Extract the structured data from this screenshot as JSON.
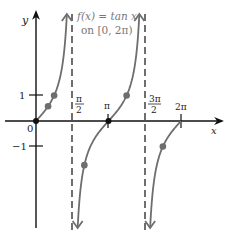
{
  "chart_data": {
    "type": "line",
    "title": "f(x) = tan x on [0, 2π)",
    "title_lines": [
      "f(x) = tan x",
      "on [0, 2π)"
    ],
    "xlabel": "x",
    "ylabel": "y",
    "function": "tan x",
    "domain": "[0, 2π)",
    "xlim": [
      0,
      6.2832
    ],
    "ylim": [
      -4.5,
      4.5
    ],
    "grid": false,
    "x_ticks": [
      {
        "value": 1.5708,
        "label": "π/2"
      },
      {
        "value": 3.1416,
        "label": "π"
      },
      {
        "value": 4.7124,
        "label": "3π/2"
      },
      {
        "value": 6.2832,
        "label": "2π"
      }
    ],
    "y_ticks": [
      {
        "value": 1,
        "label": "1"
      },
      {
        "value": -1,
        "label": "−1"
      }
    ],
    "origin_label": "0",
    "asymptotes": [
      1.5708,
      4.7124
    ],
    "series": [
      {
        "name": "tan x branch 1",
        "x_range": [
          0,
          1.5708
        ]
      },
      {
        "name": "tan x branch 2",
        "x_range": [
          1.5708,
          4.7124
        ]
      },
      {
        "name": "tan x branch 3",
        "x_range": [
          4.7124,
          6.2832
        ]
      }
    ],
    "points": [
      {
        "x": 0,
        "y": 0,
        "label": "0"
      },
      {
        "x": 0.5236,
        "y": 0.577,
        "label": "π/6"
      },
      {
        "x": 0.7854,
        "y": 1,
        "label": "π/4"
      },
      {
        "x": 2.0944,
        "y": -1.732,
        "label": "2π/3"
      },
      {
        "x": 3.1416,
        "y": 0,
        "label": "π"
      },
      {
        "x": 3.927,
        "y": 1,
        "label": "5π/4"
      },
      {
        "x": 5.4978,
        "y": -1,
        "label": "7π/4"
      }
    ]
  },
  "labels": {
    "title_line1": "f(x) = tan x",
    "title_line2": "on [0, 2π)",
    "y_axis": "y",
    "x_axis": "x",
    "origin": "0",
    "ytick_pos": "1",
    "ytick_neg": "−1",
    "pi": "π",
    "two_pi": "2π",
    "pi_half_num": "π",
    "pi_half_den": "2",
    "three_pi_half_num": "3π",
    "three_pi_half_den": "2"
  },
  "colors": {
    "axis": "#111111",
    "curve": "#6e6e6e",
    "point": "#6e6e6e",
    "asymptote": "#222222",
    "title": "#777777"
  }
}
